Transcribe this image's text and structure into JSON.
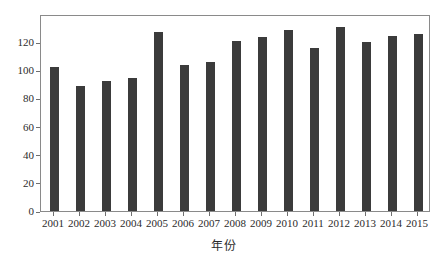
{
  "chart_data": {
    "type": "bar",
    "title": "",
    "xlabel": "年份",
    "ylabel": "",
    "categories": [
      "2001",
      "2002",
      "2003",
      "2004",
      "2005",
      "2006",
      "2007",
      "2008",
      "2009",
      "2010",
      "2011",
      "2012",
      "2013",
      "2014",
      "2015"
    ],
    "values": [
      102,
      89,
      92.5,
      94.5,
      127,
      104,
      106,
      121,
      124,
      128.5,
      115.5,
      130.5,
      120,
      124.5,
      125.5
    ],
    "ylim": [
      0,
      140
    ],
    "yticks": [
      0,
      20,
      40,
      60,
      80,
      100,
      120
    ],
    "ytick_labels": [
      "0",
      "20",
      "40",
      "60",
      "80",
      "100",
      "120"
    ],
    "grid": false,
    "legend": null,
    "bar_color": "#3b3b3b",
    "frame_color": "#8a8a8a",
    "background_color": "#ffffff"
  }
}
